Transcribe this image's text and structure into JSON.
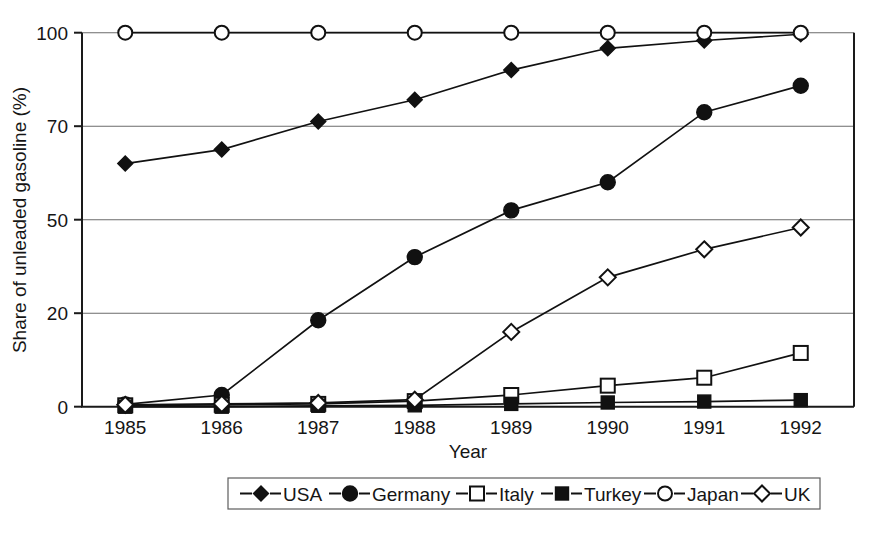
{
  "chart_data": {
    "type": "line",
    "title": "",
    "xlabel": "Year",
    "ylabel": "Share of unleaded gasoline (%)",
    "categories": [
      "1985",
      "1986",
      "1987",
      "1988",
      "1989",
      "1990",
      "1991",
      "1992"
    ],
    "x": [
      1985,
      1986,
      1987,
      1988,
      1989,
      1990,
      1991,
      1992
    ],
    "ytick_labels": [
      "0",
      "20",
      "50",
      "70",
      "100"
    ],
    "ytick_values": [
      0,
      20,
      50,
      70,
      100
    ],
    "ylim": [
      0,
      100
    ],
    "y_axis_note": "non-linear: ticks 0, 20, 50, 70, 100 are equally spaced",
    "grid": "horizontal gridlines at 20, 50, 70, 100",
    "legend_position": "bottom-center",
    "series": [
      {
        "name": "USA",
        "marker": "filled-diamond",
        "values": [
          62,
          65,
          71.5,
          78.5,
          88,
          95,
          97.5,
          99.5
        ]
      },
      {
        "name": "Germany",
        "marker": "filled-circle",
        "values": [
          0.5,
          2.5,
          18.5,
          38,
          52,
          58,
          74.5,
          83
        ]
      },
      {
        "name": "Italy",
        "marker": "open-square",
        "values": [
          0.3,
          0.4,
          0.6,
          1.2,
          2.5,
          4.5,
          6.2,
          11.5
        ]
      },
      {
        "name": "Turkey",
        "marker": "filled-square",
        "values": [
          0,
          0,
          0.2,
          0.3,
          0.6,
          0.9,
          1.1,
          1.4
        ]
      },
      {
        "name": "Japan",
        "marker": "open-circle",
        "values": [
          100,
          100,
          100,
          100,
          100,
          100,
          100,
          100
        ]
      },
      {
        "name": "UK",
        "marker": "open-diamond",
        "values": [
          0.4,
          0.6,
          0.8,
          1.5,
          16,
          31.5,
          40.5,
          47.5
        ]
      }
    ]
  },
  "legend": {
    "items": [
      {
        "label": "USA",
        "marker": "filled-diamond"
      },
      {
        "label": "Germany",
        "marker": "filled-circle"
      },
      {
        "label": "Italy",
        "marker": "open-square"
      },
      {
        "label": "Turkey",
        "marker": "filled-square"
      },
      {
        "label": "Japan",
        "marker": "open-circle"
      },
      {
        "label": "UK",
        "marker": "open-diamond"
      }
    ]
  },
  "colors": {
    "ink": "#111111",
    "grid": "#6b6b6b",
    "background": "#ffffff"
  }
}
